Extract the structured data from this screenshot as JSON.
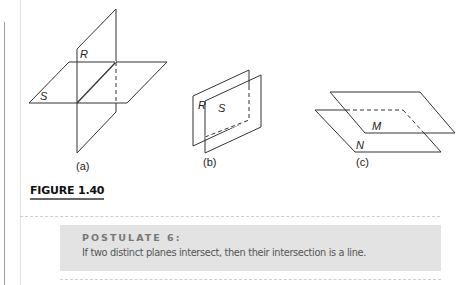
{
  "figure": {
    "caption": "FIGURE 1.40",
    "panels": [
      {
        "id": "a",
        "label": "(a)",
        "planes": [
          "R",
          "S"
        ],
        "description": "two planes intersecting in a line"
      },
      {
        "id": "b",
        "label": "(b)",
        "planes": [
          "R",
          "S"
        ],
        "description": "two parallel vertical planes"
      },
      {
        "id": "c",
        "label": "(c)",
        "planes": [
          "M",
          "N"
        ],
        "description": "two parallel horizontal planes"
      }
    ]
  },
  "postulate": {
    "title": "POSTULATE 6:",
    "text": "If two distinct planes intersect, then their intersection is a line."
  },
  "colors": {
    "line": "#333333",
    "box_background": "#e3e3e3",
    "title_gray": "#777777"
  }
}
